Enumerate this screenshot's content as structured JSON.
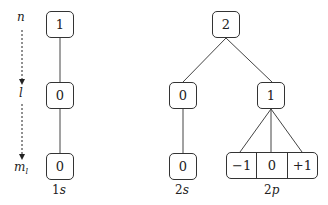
{
  "axis": {
    "n": "n",
    "l": "l",
    "ml": "m",
    "ml_sub": "l"
  },
  "tree_1s": {
    "n": "1",
    "l": "0",
    "ml": "0",
    "label_num": "1",
    "label_let": "s"
  },
  "tree_2": {
    "n": "2",
    "s": {
      "l": "0",
      "ml": "0",
      "label_num": "2",
      "label_let": "s"
    },
    "p": {
      "l": "1",
      "ml": [
        "−1",
        "0",
        "+1"
      ],
      "label_num": "2",
      "label_let": "p"
    }
  }
}
